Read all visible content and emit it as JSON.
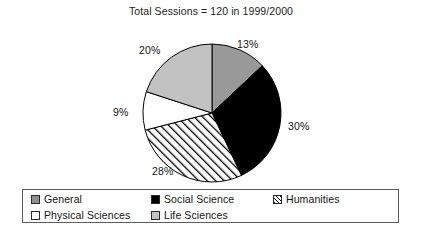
{
  "chart_data": {
    "type": "pie",
    "title": "Total Sessions = 120 in 1999/2000",
    "total_sessions": 120,
    "period": "1999/2000",
    "xlabel": "",
    "ylabel": "",
    "legend_position": "bottom",
    "grid": false,
    "start_angle_deg": 0,
    "direction": "clockwise",
    "categories": [
      "General",
      "Social Science",
      "Humanities",
      "Physical Sciences",
      "Life Sciences"
    ],
    "values": [
      13,
      30,
      28,
      9,
      20
    ],
    "labels": [
      "13%",
      "30%",
      "28%",
      "9%",
      "20%"
    ],
    "slices": [
      {
        "name": "General",
        "value": 13,
        "label": "13%",
        "fill": "#999999",
        "pattern": "solid",
        "label_x": 237,
        "label_y": 38
      },
      {
        "name": "Social Science",
        "value": 30,
        "label": "30%",
        "fill": "#000000",
        "pattern": "solid",
        "label_x": 288,
        "label_y": 120
      },
      {
        "name": "Humanities",
        "value": 28,
        "label": "28%",
        "fill": "#ffffff",
        "pattern": "diagonal-hatch",
        "label_x": 152,
        "label_y": 165
      },
      {
        "name": "Physical Sciences",
        "value": 9,
        "label": "9%",
        "fill": "#ffffff",
        "pattern": "solid",
        "label_x": 113,
        "label_y": 106
      },
      {
        "name": "Life Sciences",
        "value": 20,
        "label": "20%",
        "fill": "#c2c2c2",
        "pattern": "solid",
        "label_x": 139,
        "label_y": 44
      }
    ],
    "geometry": {
      "center_x": 212,
      "center_y": 113,
      "radius": 69
    }
  },
  "legend": {
    "rows": [
      [
        {
          "label": "General",
          "swatch": "solid",
          "fill": "#8f8f8f",
          "x": 8
        },
        {
          "label": "Social Science",
          "swatch": "solid",
          "fill": "#000000",
          "x": 128
        },
        {
          "label": "Humanities",
          "swatch": "hatch",
          "fill": "#ffffff",
          "x": 250
        }
      ],
      [
        {
          "label": "Physical Sciences",
          "swatch": "solid",
          "fill": "#ffffff",
          "x": 8
        },
        {
          "label": "Life Sciences",
          "swatch": "solid",
          "fill": "#c2c2c2",
          "x": 128
        }
      ]
    ]
  },
  "colors": {
    "general": "#999999",
    "social_science": "#000000",
    "humanities": "#ffffff",
    "physical_sciences": "#ffffff",
    "life_sciences": "#c2c2c2",
    "outline": "#000000",
    "legend_border": "#5d5d5d",
    "background": "#ffffff"
  }
}
